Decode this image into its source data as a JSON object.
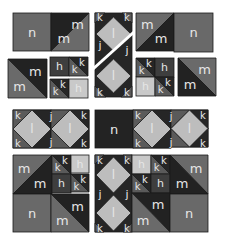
{
  "colors": {
    "h_light": "#c9c9c9",
    "h_dark": "#3e3e3e",
    "j": "#262626",
    "k": "#5a5a5a",
    "l": "#bdbdbd",
    "m_mid": "#6a6a6a",
    "m_dark": "#222222",
    "n_mid": "#696969",
    "n_dark": "#232323",
    "border": "#1a1a1a",
    "label": "#e8e8e8",
    "background": "#ffffff"
  },
  "labels": {
    "h": "h",
    "j": "j",
    "k": "k",
    "l": "l",
    "m": "m",
    "n": "n"
  },
  "groups": [
    {
      "name": "top-left-pair",
      "pieces": [
        "n",
        "m-triangle-pair"
      ]
    },
    {
      "name": "left-m-square",
      "pieces": [
        "m-triangle-pair"
      ]
    },
    {
      "name": "small-hk-tiles-left",
      "pieces": [
        "h",
        "k-pair",
        "k-pair",
        "h"
      ]
    },
    {
      "name": "vertical-diamond-strip",
      "pieces": [
        "l",
        "l",
        "j",
        "j",
        "k",
        "k",
        "k",
        "k"
      ]
    },
    {
      "name": "top-right-pair",
      "pieces": [
        "m-triangle-pair",
        "n"
      ]
    },
    {
      "name": "small-hk-tiles-right",
      "pieces": [
        "k-pair",
        "h",
        "h",
        "k-pair"
      ]
    },
    {
      "name": "right-m-square",
      "pieces": [
        "m-triangle-pair"
      ]
    },
    {
      "name": "horizontal-diamond-strip",
      "pieces": [
        "l",
        "l",
        "j",
        "j",
        "k",
        "k",
        "k",
        "k"
      ]
    },
    {
      "name": "n-with-diamond-strip",
      "pieces": [
        "n",
        "l",
        "l",
        "j",
        "j",
        "k",
        "k",
        "k",
        "k"
      ]
    },
    {
      "name": "bottom-left-block",
      "pieces": [
        "m-triangle-pair",
        "h",
        "h",
        "k-pair",
        "k-pair",
        "m-triangle-pair",
        "n"
      ]
    },
    {
      "name": "bottom-right-block",
      "pieces": [
        "l",
        "l",
        "j",
        "j",
        "k",
        "k",
        "h",
        "h",
        "k-pair",
        "k-pair",
        "m-triangle-pair",
        "m-triangle-pair",
        "n"
      ]
    }
  ]
}
